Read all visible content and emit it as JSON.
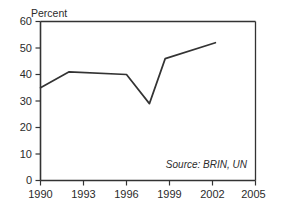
{
  "chart_data": {
    "type": "line",
    "title": "",
    "subtitle": "",
    "xlabel": "",
    "ylabel": "Percent",
    "ylabel_position": "top-left-above-axis",
    "xlim": [
      1990,
      2005
    ],
    "ylim": [
      0,
      60
    ],
    "grid": false,
    "legend": false,
    "legend_position": "none",
    "xticks": [
      "1990",
      "1993",
      "1996",
      "1999",
      "2002",
      "2005"
    ],
    "xtick_values": [
      1990,
      1993,
      1996,
      1999,
      2002,
      2005
    ],
    "yticks": [
      "0",
      "10",
      "20",
      "30",
      "40",
      "50",
      "60"
    ],
    "ytick_values": [
      0,
      10,
      20,
      30,
      40,
      50,
      60
    ],
    "series": [
      {
        "name": "Percent",
        "color": "#333333",
        "x": [
          1990,
          1992,
          1996,
          1997.6,
          1998.7,
          2002.2
        ],
        "values": [
          35,
          41,
          40,
          29,
          46,
          52
        ]
      }
    ],
    "annotations": [
      {
        "name": "source-note",
        "text": "Source: BRIN, UN",
        "style": "italic",
        "position": "bottom-right-inside-plot"
      }
    ],
    "axis_color": "#333333",
    "line_color": "#333333",
    "background": "#ffffff"
  },
  "axis_label": {
    "y": "Percent"
  },
  "source_note": {
    "text": "Source: BRIN, UN"
  }
}
